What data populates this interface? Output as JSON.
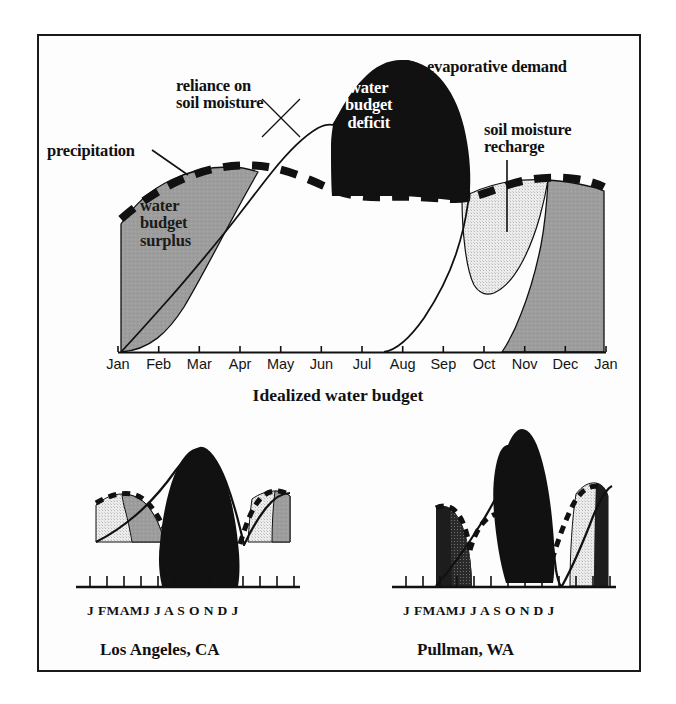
{
  "figure": {
    "title": "Idealized water budget",
    "frame_color": "#1a1a1a",
    "background": "#ffffff"
  },
  "palette": {
    "surplus_gray": "#9d9d9d",
    "recharge_light": "#e2e2e2",
    "deficit_black": "#111111",
    "line_black": "#111111",
    "text_black": "#111111",
    "text_white": "#ffffff"
  },
  "main_chart": {
    "annotations": {
      "precipitation": "precipitation",
      "reliance_on_soil_moisture": "reliance on\nsoil moisture",
      "evaporative_demand": "evaporative demand",
      "soil_moisture_recharge": "soil moisture\nrecharge",
      "water_budget_deficit": "water\nbudget\ndeficit",
      "water_budget_surplus": "water\nbudget\nsurplus"
    },
    "months": [
      "Jan",
      "Feb",
      "Mar",
      "Apr",
      "May",
      "Jun",
      "Jul",
      "Aug",
      "Sep",
      "Oct",
      "Nov",
      "Dec",
      "Jan"
    ],
    "caption": "Idealized water budget"
  },
  "sub_charts": [
    {
      "id": "los-angeles",
      "caption": "Los Angeles, CA",
      "months": "J FMAMJ J A S O N D J"
    },
    {
      "id": "pullman",
      "caption": "Pullman, WA",
      "months": "J FMAMJ J A S O N D J"
    }
  ],
  "chart_data": {
    "type": "area",
    "title": "Idealized water budget",
    "xlabel": "",
    "ylabel": "",
    "grid": false,
    "legend": "none",
    "x": [
      "Jan",
      "Feb",
      "Mar",
      "Apr",
      "May",
      "Jun",
      "Jul",
      "Aug",
      "Sep",
      "Oct",
      "Nov",
      "Dec",
      "Jan"
    ],
    "series": [
      {
        "name": "precipitation",
        "style": "thick dashed black line",
        "values": [
          52,
          57,
          59,
          57,
          55,
          56,
          57,
          58,
          57,
          55,
          54,
          56,
          58
        ]
      },
      {
        "name": "potential evapotranspiration (evaporative demand)",
        "style": "thin solid black curve",
        "values": [
          2,
          6,
          14,
          30,
          52,
          76,
          92,
          96,
          82,
          55,
          24,
          7,
          2
        ]
      }
    ],
    "regions": [
      {
        "name": "water budget surplus",
        "fill": "#9d9d9d",
        "months": [
          "Jan",
          "Feb",
          "Mar",
          "Apr",
          "May",
          "Nov",
          "Dec",
          "Jan"
        ],
        "description": "precipitation exceeds demand and soil storage is full"
      },
      {
        "name": "water budget deficit",
        "fill": "#111111",
        "months": [
          "Jun",
          "Jul",
          "Aug",
          "Sep",
          "Oct"
        ],
        "description": "evaporative demand exceeds precipitation plus available soil moisture"
      },
      {
        "name": "soil moisture recharge",
        "fill": "#e2e2e2",
        "months": [
          "Oct",
          "Nov",
          "Dec"
        ],
        "description": "precipitation refills depleted soil storage"
      },
      {
        "name": "reliance on soil moisture",
        "fill": "none",
        "months": [
          "May",
          "Jun",
          "Jul"
        ],
        "description": "demand met by drawing down stored soil water"
      }
    ],
    "subplots": [
      {
        "title": "Los Angeles, CA",
        "type": "area",
        "x": [
          "J",
          "F",
          "M",
          "A",
          "M",
          "J",
          "J",
          "A",
          "S",
          "O",
          "N",
          "D",
          "J"
        ],
        "series": [
          {
            "name": "precipitation",
            "style": "thick dashed black line",
            "values": [
              72,
              66,
              54,
              30,
              12,
              4,
              2,
              2,
              5,
              18,
              40,
              64,
              74
            ]
          },
          {
            "name": "evaporative demand",
            "style": "thin solid black curve",
            "values": [
              20,
              27,
              38,
              54,
              72,
              88,
              96,
              92,
              78,
              58,
              36,
              23,
              20
            ]
          }
        ],
        "regions": [
          {
            "name": "water budget surplus",
            "fill": "#9d9d9d",
            "months": [
              "J",
              "F",
              "D",
              "J"
            ]
          },
          {
            "name": "water budget deficit",
            "fill": "#111111",
            "months": [
              "M",
              "J",
              "J",
              "A",
              "S",
              "O"
            ]
          },
          {
            "name": "soil moisture recharge",
            "fill": "#e2e2e2",
            "months": [
              "N",
              "D",
              "J"
            ]
          }
        ]
      },
      {
        "title": "Pullman, WA",
        "type": "area",
        "x": [
          "J",
          "F",
          "M",
          "A",
          "M",
          "J",
          "J",
          "A",
          "S",
          "O",
          "N",
          "D",
          "J"
        ],
        "series": [
          {
            "name": "precipitation",
            "style": "thick dashed black line",
            "values": [
              62,
              56,
              44,
              34,
              30,
              28,
              14,
              12,
              22,
              40,
              58,
              64,
              62
            ]
          },
          {
            "name": "evaporative demand",
            "style": "thin solid black curve",
            "values": [
              4,
              8,
              18,
              36,
              60,
              86,
              100,
              94,
              70,
              42,
              16,
              5,
              4
            ]
          }
        ],
        "regions": [
          {
            "name": "water budget surplus",
            "fill": "#9d9d9d",
            "months": [
              "J",
              "F",
              "D",
              "J"
            ]
          },
          {
            "name": "water budget deficit",
            "fill": "#111111",
            "months": [
              "J",
              "J",
              "A",
              "S",
              "O"
            ]
          },
          {
            "name": "soil moisture recharge",
            "fill": "#e2e2e2",
            "months": [
              "O",
              "N",
              "D"
            ]
          }
        ]
      }
    ]
  }
}
